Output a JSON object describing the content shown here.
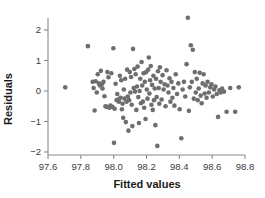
{
  "chart_data": {
    "type": "scatter",
    "title": "",
    "xlabel": "Fitted values",
    "ylabel": "Residuals",
    "xlim": [
      97.6,
      98.8
    ],
    "ylim": [
      -2.0,
      2.45
    ],
    "xticks": [
      97.6,
      97.8,
      98.0,
      98.2,
      98.4,
      98.6,
      98.8
    ],
    "xticklabels": [
      "97.6",
      "97.8",
      "98.0",
      "98.2",
      "98.4",
      "98.6",
      "98.8"
    ],
    "yticks": [
      -2,
      -1,
      0,
      1,
      2
    ],
    "yticklabels": [
      "−2",
      "−1",
      "0",
      "1",
      "2"
    ],
    "grid": false,
    "legend": null,
    "marker": {
      "shape": "circle",
      "size": 2.3,
      "color": "#6e6e6e"
    },
    "axis_color": "#8a8a8a",
    "n_points": 130,
    "points": [
      [
        97.705,
        0.12
      ],
      [
        97.843,
        1.47
      ],
      [
        97.872,
        0.3
      ],
      [
        97.878,
        0.1
      ],
      [
        97.884,
        -0.64
      ],
      [
        97.89,
        0.32
      ],
      [
        97.897,
        -0.05
      ],
      [
        97.903,
        0.55
      ],
      [
        97.91,
        0.25
      ],
      [
        97.916,
        0.18
      ],
      [
        97.922,
        0.66
      ],
      [
        97.928,
        0.22
      ],
      [
        97.932,
        0.08
      ],
      [
        97.938,
        0.3
      ],
      [
        97.944,
        -0.17
      ],
      [
        97.95,
        -0.5
      ],
      [
        97.956,
        -0.52
      ],
      [
        97.962,
        0.62
      ],
      [
        97.968,
        0.45
      ],
      [
        97.974,
        -0.55
      ],
      [
        97.98,
        -0.48
      ],
      [
        97.986,
        0.58
      ],
      [
        97.992,
        -0.52
      ],
      [
        97.998,
        1.4
      ],
      [
        98.002,
        -1.7
      ],
      [
        98.006,
        -0.58
      ],
      [
        98.012,
        0.24
      ],
      [
        98.018,
        -0.3
      ],
      [
        98.022,
        -0.1
      ],
      [
        98.028,
        -0.28
      ],
      [
        98.032,
        -0.35
      ],
      [
        98.038,
        0.5
      ],
      [
        98.042,
        -0.22
      ],
      [
        98.046,
        0.35
      ],
      [
        98.05,
        -0.6
      ],
      [
        98.054,
        -0.42
      ],
      [
        98.058,
        -0.88
      ],
      [
        98.062,
        0.05
      ],
      [
        98.066,
        -0.25
      ],
      [
        98.07,
        0.4
      ],
      [
        98.074,
        -1.02
      ],
      [
        98.078,
        -0.35
      ],
      [
        98.082,
        0.7
      ],
      [
        98.086,
        -0.18
      ],
      [
        98.09,
        -1.3
      ],
      [
        98.094,
        -0.3
      ],
      [
        98.098,
        0.62
      ],
      [
        98.102,
        -0.05
      ],
      [
        98.106,
        0.46
      ],
      [
        98.11,
        -0.45
      ],
      [
        98.114,
        -1.15
      ],
      [
        98.118,
        1.38
      ],
      [
        98.122,
        0.1
      ],
      [
        98.126,
        0.72
      ],
      [
        98.13,
        -0.02
      ],
      [
        98.134,
        0.55
      ],
      [
        98.138,
        -0.62
      ],
      [
        98.142,
        0.15
      ],
      [
        98.146,
        0.8
      ],
      [
        98.15,
        -0.2
      ],
      [
        98.154,
        -1.05
      ],
      [
        98.158,
        0.0
      ],
      [
        98.162,
        0.4
      ],
      [
        98.166,
        -0.4
      ],
      [
        98.17,
        0.95
      ],
      [
        98.174,
        0.18
      ],
      [
        98.178,
        -0.35
      ],
      [
        98.182,
        0.58
      ],
      [
        98.186,
        -0.55
      ],
      [
        98.19,
        0.3
      ],
      [
        98.194,
        -0.92
      ],
      [
        98.198,
        0.62
      ],
      [
        98.202,
        0.05
      ],
      [
        98.206,
        -0.25
      ],
      [
        98.21,
        0.7
      ],
      [
        98.214,
        1.1
      ],
      [
        98.218,
        -0.08
      ],
      [
        98.222,
        0.35
      ],
      [
        98.226,
        0.82
      ],
      [
        98.23,
        -0.45
      ],
      [
        98.234,
        0.2
      ],
      [
        98.238,
        -0.62
      ],
      [
        98.242,
        0.5
      ],
      [
        98.246,
        -0.3
      ],
      [
        98.25,
        0.08
      ],
      [
        98.254,
        -1.12
      ],
      [
        98.258,
        0.4
      ],
      [
        98.262,
        -0.2
      ],
      [
        98.266,
        -1.8
      ],
      [
        98.27,
        0.65
      ],
      [
        98.274,
        0.1
      ],
      [
        98.278,
        -0.42
      ],
      [
        98.282,
        0.78
      ],
      [
        98.286,
        0.3
      ],
      [
        98.292,
        -0.28
      ],
      [
        98.298,
        0.52
      ],
      [
        98.304,
        0.05
      ],
      [
        98.31,
        0.22
      ],
      [
        98.316,
        -0.5
      ],
      [
        98.322,
        0.68
      ],
      [
        98.328,
        0.18
      ],
      [
        98.334,
        -0.05
      ],
      [
        98.34,
        0.42
      ],
      [
        98.346,
        -0.35
      ],
      [
        98.352,
        0.3
      ],
      [
        98.358,
        -0.22
      ],
      [
        98.364,
        0.1
      ],
      [
        98.37,
        -0.48
      ],
      [
        98.378,
        0.55
      ],
      [
        98.386,
        -0.1
      ],
      [
        98.394,
        0.25
      ],
      [
        98.402,
        -0.6
      ],
      [
        98.412,
        -1.55
      ],
      [
        98.42,
        0.05
      ],
      [
        98.428,
        0.3
      ],
      [
        98.436,
        -0.18
      ],
      [
        98.444,
        0.88
      ],
      [
        98.452,
        2.4
      ],
      [
        98.458,
        -0.65
      ],
      [
        98.464,
        0.12
      ],
      [
        98.47,
        1.5
      ],
      [
        98.476,
        0.3
      ],
      [
        98.482,
        1.35
      ],
      [
        98.488,
        -0.25
      ],
      [
        98.494,
        0.62
      ],
      [
        98.5,
        -0.05
      ],
      [
        98.506,
        0.4
      ],
      [
        98.512,
        -0.3
      ],
      [
        98.518,
        0.08
      ],
      [
        98.524,
        0.6
      ],
      [
        98.53,
        -0.15
      ],
      [
        98.536,
        -0.4
      ],
      [
        98.542,
        0.25
      ],
      [
        98.548,
        0.55
      ],
      [
        98.554,
        -0.08
      ],
      [
        98.56,
        0.18
      ],
      [
        98.566,
        -0.22
      ],
      [
        98.572,
        0.3
      ],
      [
        98.58,
        -0.05
      ],
      [
        98.588,
        0.12
      ],
      [
        98.596,
        0.22
      ],
      [
        98.604,
        -0.18
      ],
      [
        98.612,
        0.05
      ],
      [
        98.62,
        0.15
      ],
      [
        98.628,
        -0.1
      ],
      [
        98.636,
        -0.85
      ],
      [
        98.644,
        0.02
      ],
      [
        98.652,
        -0.05
      ],
      [
        98.66,
        0.08
      ],
      [
        98.672,
        -0.02
      ],
      [
        98.688,
        -0.68
      ],
      [
        98.71,
        0.1
      ],
      [
        98.74,
        -0.68
      ],
      [
        98.762,
        0.12
      ]
    ]
  }
}
